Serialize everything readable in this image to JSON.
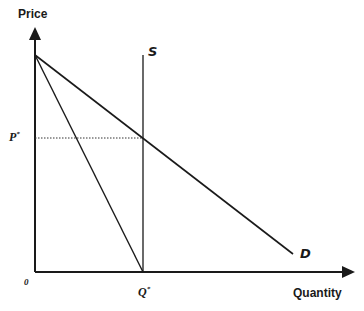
{
  "diagram": {
    "type": "supply-demand",
    "y_axis_label": "Price",
    "x_axis_label": "Quantity",
    "origin_label": "0",
    "price_label": "P",
    "price_sup": "*",
    "quantity_label": "Q",
    "quantity_sup": "*",
    "supply_label": "S",
    "demand_label": "D",
    "line_color": "#1a1a1a"
  }
}
